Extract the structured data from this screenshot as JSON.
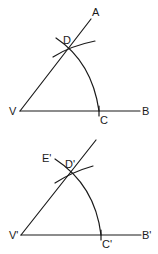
{
  "figures": [
    {
      "name": "original-angle",
      "labels": {
        "vertex": "V",
        "ray_upper_end": "A",
        "ray_lower_end": "B",
        "arc_on_upper": "D",
        "arc_on_lower": "C"
      }
    },
    {
      "name": "copied-angle",
      "labels": {
        "vertex": "V'",
        "ray_lower_end": "B'",
        "arc_start": "E'",
        "arc_on_upper": "D'",
        "arc_on_lower": "C'"
      }
    }
  ],
  "colors": {
    "stroke": "#1a1a1a",
    "background": "#ffffff"
  }
}
